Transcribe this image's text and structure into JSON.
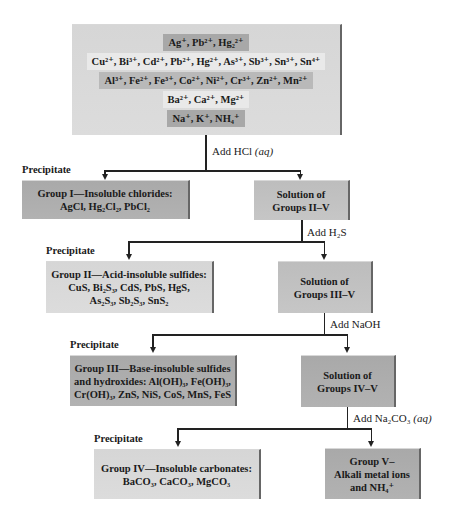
{
  "top_box": {
    "rows": [
      {
        "text": "Ag⁺, Pb²⁺, Hg₂²⁺",
        "shade": "dark"
      },
      {
        "text": "Cu²⁺, Bi³⁺, Cd²⁺, Pb²⁺, Hg²⁺, As³⁺, Sb³⁺, Sn³⁺, Sn⁴⁺",
        "shade": "light"
      },
      {
        "text": "Al³⁺, Fe²⁺, Fe³⁺, Co²⁺, Ni²⁺, Cr³⁺, Zn²⁺, Mn²⁺",
        "shade": "dark"
      },
      {
        "text": "Ba²⁺, Ca²⁺, Mg²⁺",
        "shade": "light"
      },
      {
        "text": "Na⁺, K⁺, NH₄⁺",
        "shade": "dark"
      }
    ]
  },
  "steps": [
    {
      "reagent": "Add HCl",
      "state": "(aq)"
    },
    {
      "reagent": "Add H₂S",
      "state": ""
    },
    {
      "reagent": "Add NaOH",
      "state": ""
    },
    {
      "reagent": "Add Na₂CO₃",
      "state": "(aq)"
    }
  ],
  "precipitate_label": "Precipitate",
  "precipitates": [
    {
      "title": "Group I—Insoluble chlorides:",
      "lines": [
        "AgCl, Hg₂Cl₂, PbCl₂"
      ]
    },
    {
      "title": "Group II—Acid-insoluble sulfides:",
      "lines": [
        "CuS, Bi₂S₃, CdS, PbS, HgS,",
        "As₂S₃, Sb₂S₃, SnS₂"
      ]
    },
    {
      "title": "Group III—Base-insoluble sulfides",
      "lines": [
        "and hydroxides: Al(OH)₃, Fe(OH)₃,",
        "Cr(OH)₃, ZnS, NiS, CoS, MnS, FeS"
      ]
    },
    {
      "title": "Group IV—Insoluble carbonates:",
      "lines": [
        "BaCO₃, CaCO₃, MgCO₃"
      ]
    }
  ],
  "solutions": [
    {
      "lines": [
        "Solution of",
        "Groups II–V"
      ]
    },
    {
      "lines": [
        "Solution of",
        "Groups III–V"
      ]
    },
    {
      "lines": [
        "Solution of",
        "Groups IV–V"
      ]
    },
    {
      "lines": [
        "Group V–",
        "Alkali metal ions",
        "and NH₄⁺"
      ]
    }
  ],
  "colors": {
    "dark_box": "#a9a9a9",
    "light_box": "#d8d8d8",
    "mid_box": "#bdbdbd",
    "line": "#222222"
  }
}
